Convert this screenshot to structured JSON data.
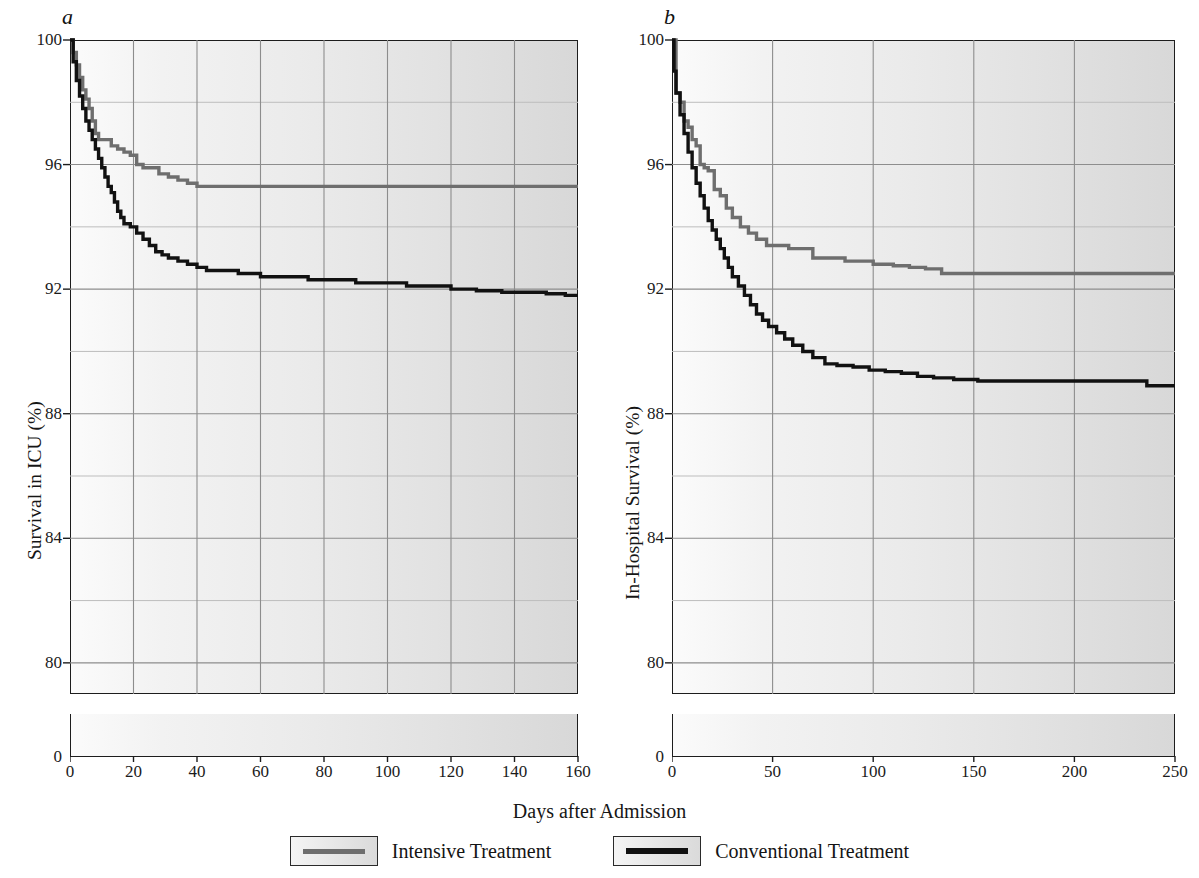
{
  "figure": {
    "xlabel": "Days after Admission",
    "panels": [
      {
        "letter": "a",
        "ylabel": "Survival in ICU (%)",
        "xticks": [
          "0",
          "20",
          "40",
          "60",
          "80",
          "100",
          "120",
          "140",
          "160"
        ],
        "yticks": [
          "80",
          "84",
          "88",
          "92",
          "96",
          "100"
        ],
        "zero_tick": "0"
      },
      {
        "letter": "b",
        "ylabel": "In-Hospital Survival (%)",
        "xticks": [
          "0",
          "50",
          "100",
          "150",
          "200",
          "250"
        ],
        "yticks": [
          "80",
          "84",
          "88",
          "92",
          "96",
          "100"
        ],
        "zero_tick": "0"
      }
    ]
  },
  "legend": {
    "position": "bottom-center",
    "items": [
      {
        "label": "Intensive Treatment",
        "color": "#6e6e6e"
      },
      {
        "label": "Conventional Treatment",
        "color": "#111111"
      }
    ]
  },
  "colors": {
    "intensive": "#6e6e6e",
    "conventional": "#111111",
    "grid_major": "#8d8d8d",
    "grid_minor": "#bdbdbd",
    "axis": "#1d1d1d"
  },
  "chart_data": [
    {
      "type": "line",
      "subtype": "kaplan-meier-step",
      "panel": "a",
      "title": "a",
      "xlabel": "Days after Admission",
      "ylabel": "Survival in ICU (%)",
      "xlim": [
        0,
        160
      ],
      "ylim": [
        79,
        100
      ],
      "yticks": [
        80,
        84,
        88,
        92,
        96,
        100
      ],
      "yticks_minor": [
        82,
        86,
        90,
        94,
        98
      ],
      "xticks": [
        0,
        20,
        40,
        60,
        80,
        100,
        120,
        140,
        160
      ],
      "grid": true,
      "axis_break_below": 79,
      "series": [
        {
          "name": "Intensive Treatment",
          "color": "#6e6e6e",
          "points": [
            [
              0,
              100.0
            ],
            [
              1,
              99.6
            ],
            [
              2,
              99.2
            ],
            [
              3,
              98.8
            ],
            [
              4,
              98.4
            ],
            [
              5,
              98.1
            ],
            [
              6,
              97.8
            ],
            [
              7,
              97.4
            ],
            [
              8,
              97.0
            ],
            [
              9,
              96.8
            ],
            [
              10,
              96.8
            ],
            [
              13,
              96.6
            ],
            [
              15,
              96.5
            ],
            [
              17,
              96.4
            ],
            [
              19,
              96.3
            ],
            [
              21,
              96.0
            ],
            [
              23,
              95.9
            ],
            [
              26,
              95.9
            ],
            [
              28,
              95.7
            ],
            [
              31,
              95.6
            ],
            [
              34,
              95.5
            ],
            [
              37,
              95.4
            ],
            [
              40,
              95.3
            ],
            [
              44,
              95.3
            ],
            [
              160,
              95.3
            ]
          ]
        },
        {
          "name": "Conventional Treatment",
          "color": "#111111",
          "points": [
            [
              0,
              100.0
            ],
            [
              1,
              99.3
            ],
            [
              2,
              98.7
            ],
            [
              3,
              98.2
            ],
            [
              4,
              97.8
            ],
            [
              5,
              97.4
            ],
            [
              6,
              97.1
            ],
            [
              7,
              96.8
            ],
            [
              8,
              96.5
            ],
            [
              9,
              96.2
            ],
            [
              10,
              95.9
            ],
            [
              11,
              95.6
            ],
            [
              12,
              95.3
            ],
            [
              13,
              95.1
            ],
            [
              14,
              94.8
            ],
            [
              15,
              94.5
            ],
            [
              16,
              94.3
            ],
            [
              17,
              94.1
            ],
            [
              19,
              94.0
            ],
            [
              21,
              93.8
            ],
            [
              23,
              93.6
            ],
            [
              25,
              93.4
            ],
            [
              27,
              93.2
            ],
            [
              29,
              93.1
            ],
            [
              31,
              93.0
            ],
            [
              34,
              92.9
            ],
            [
              37,
              92.8
            ],
            [
              40,
              92.7
            ],
            [
              43,
              92.6
            ],
            [
              47,
              92.6
            ],
            [
              53,
              92.5
            ],
            [
              60,
              92.4
            ],
            [
              68,
              92.4
            ],
            [
              75,
              92.3
            ],
            [
              82,
              92.3
            ],
            [
              90,
              92.2
            ],
            [
              98,
              92.2
            ],
            [
              106,
              92.1
            ],
            [
              114,
              92.1
            ],
            [
              120,
              92.0
            ],
            [
              128,
              91.95
            ],
            [
              136,
              91.9
            ],
            [
              144,
              91.9
            ],
            [
              150,
              91.85
            ],
            [
              156,
              91.8
            ],
            [
              160,
              91.8
            ]
          ]
        }
      ]
    },
    {
      "type": "line",
      "subtype": "kaplan-meier-step",
      "panel": "b",
      "title": "b",
      "xlabel": "Days after Admission",
      "ylabel": "In-Hospital Survival (%)",
      "xlim": [
        0,
        250
      ],
      "ylim": [
        79,
        100
      ],
      "yticks": [
        80,
        84,
        88,
        92,
        96,
        100
      ],
      "yticks_minor": [
        82,
        86,
        90,
        94,
        98
      ],
      "xticks": [
        0,
        50,
        100,
        150,
        200,
        250
      ],
      "grid": true,
      "axis_break_below": 79,
      "series": [
        {
          "name": "Intensive Treatment",
          "color": "#6e6e6e",
          "points": [
            [
              0,
              100.0
            ],
            [
              2,
              98.3
            ],
            [
              4,
              98.0
            ],
            [
              6,
              97.4
            ],
            [
              8,
              97.2
            ],
            [
              10,
              96.8
            ],
            [
              12,
              96.6
            ],
            [
              14,
              96.0
            ],
            [
              16,
              95.9
            ],
            [
              18,
              95.8
            ],
            [
              21,
              95.2
            ],
            [
              24,
              95.0
            ],
            [
              27,
              94.6
            ],
            [
              30,
              94.3
            ],
            [
              34,
              94.0
            ],
            [
              38,
              93.8
            ],
            [
              42,
              93.6
            ],
            [
              47,
              93.4
            ],
            [
              52,
              93.4
            ],
            [
              58,
              93.3
            ],
            [
              64,
              93.3
            ],
            [
              70,
              93.0
            ],
            [
              78,
              93.0
            ],
            [
              86,
              92.9
            ],
            [
              92,
              92.9
            ],
            [
              100,
              92.8
            ],
            [
              110,
              92.75
            ],
            [
              118,
              92.7
            ],
            [
              126,
              92.65
            ],
            [
              134,
              92.5
            ],
            [
              142,
              92.5
            ],
            [
              250,
              92.5
            ]
          ]
        },
        {
          "name": "Conventional Treatment",
          "color": "#111111",
          "points": [
            [
              0,
              100.0
            ],
            [
              1,
              99.0
            ],
            [
              2,
              98.3
            ],
            [
              4,
              97.6
            ],
            [
              6,
              97.0
            ],
            [
              8,
              96.4
            ],
            [
              10,
              95.9
            ],
            [
              12,
              95.4
            ],
            [
              14,
              95.0
            ],
            [
              16,
              94.6
            ],
            [
              18,
              94.2
            ],
            [
              20,
              93.9
            ],
            [
              22,
              93.6
            ],
            [
              24,
              93.3
            ],
            [
              26,
              93.0
            ],
            [
              28,
              92.7
            ],
            [
              30,
              92.4
            ],
            [
              33,
              92.1
            ],
            [
              36,
              91.8
            ],
            [
              39,
              91.5
            ],
            [
              42,
              91.2
            ],
            [
              45,
              91.0
            ],
            [
              48,
              90.8
            ],
            [
              52,
              90.6
            ],
            [
              56,
              90.4
            ],
            [
              60,
              90.2
            ],
            [
              65,
              90.0
            ],
            [
              70,
              89.8
            ],
            [
              76,
              89.6
            ],
            [
              82,
              89.55
            ],
            [
              90,
              89.5
            ],
            [
              98,
              89.4
            ],
            [
              106,
              89.35
            ],
            [
              114,
              89.3
            ],
            [
              122,
              89.2
            ],
            [
              130,
              89.15
            ],
            [
              140,
              89.1
            ],
            [
              152,
              89.05
            ],
            [
              170,
              89.05
            ],
            [
              200,
              89.05
            ],
            [
              228,
              89.05
            ],
            [
              236,
              88.9
            ],
            [
              250,
              88.9
            ]
          ]
        }
      ]
    }
  ]
}
